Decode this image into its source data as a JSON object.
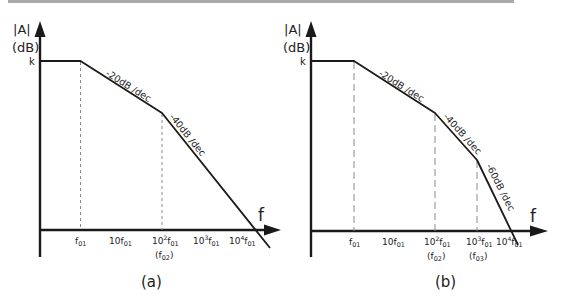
{
  "figure": {
    "panels": [
      {
        "id": "a",
        "caption": "(a)",
        "y_axis": {
          "label": "|A|",
          "unit": "(dB)",
          "level_label": "k"
        },
        "x_axis": {
          "label": "f"
        },
        "ticks": [
          {
            "base": "f",
            "exp": "",
            "sub": "01",
            "prefix": "",
            "note": ""
          },
          {
            "base": "f",
            "exp": "",
            "sub": "01",
            "prefix": "10",
            "note": ""
          },
          {
            "base": "f",
            "exp": "2",
            "sub": "01",
            "prefix": "10",
            "note": "(f02)"
          },
          {
            "base": "f",
            "exp": "3",
            "sub": "01",
            "prefix": "10",
            "note": ""
          },
          {
            "base": "f",
            "exp": "4",
            "sub": "01",
            "prefix": "10",
            "note": ""
          }
        ],
        "slopes": [
          "-20dB /dec",
          "-40dB /dec"
        ],
        "poles": [
          "f01",
          "f02"
        ]
      },
      {
        "id": "b",
        "caption": "(b)",
        "y_axis": {
          "label": "|A|",
          "unit": "(dB)",
          "level_label": "k"
        },
        "x_axis": {
          "label": "f"
        },
        "ticks": [
          {
            "base": "f",
            "exp": "",
            "sub": "01",
            "prefix": "",
            "note": ""
          },
          {
            "base": "f",
            "exp": "",
            "sub": "01",
            "prefix": "10",
            "note": ""
          },
          {
            "base": "f",
            "exp": "2",
            "sub": "01",
            "prefix": "10",
            "note": "(f02)"
          },
          {
            "base": "f",
            "exp": "3",
            "sub": "01",
            "prefix": "10",
            "note": "(f03)"
          },
          {
            "base": "f",
            "exp": "4",
            "sub": "01",
            "prefix": "10",
            "note": ""
          }
        ],
        "slopes": [
          "-20dB /dec",
          "-40dB /dec",
          "-60dB /dec"
        ],
        "poles": [
          "f01",
          "f02",
          "f03"
        ]
      }
    ]
  },
  "labels": {
    "a_y": "|A|",
    "a_unit": "(dB)",
    "a_k": "k",
    "a_f": "f",
    "a_caption": "(a)",
    "a_slope1": "-20dB /dec",
    "a_slope2": "-40dB /dec",
    "a_note_f02": "(f",
    "b_y": "|A|",
    "b_unit": "(dB)",
    "b_k": "k",
    "b_f": "f",
    "b_caption": "(b)",
    "b_slope1": "-20dB /dec",
    "b_slope2": "-40dB /dec",
    "b_slope3": "-60dB /dec",
    "f": "f",
    "ten": "10",
    "s01": "01",
    "s02": "02",
    "s03": "03",
    "e2": "2",
    "e3": "3",
    "e4": "4",
    "lp": "(",
    "rp": ")"
  }
}
